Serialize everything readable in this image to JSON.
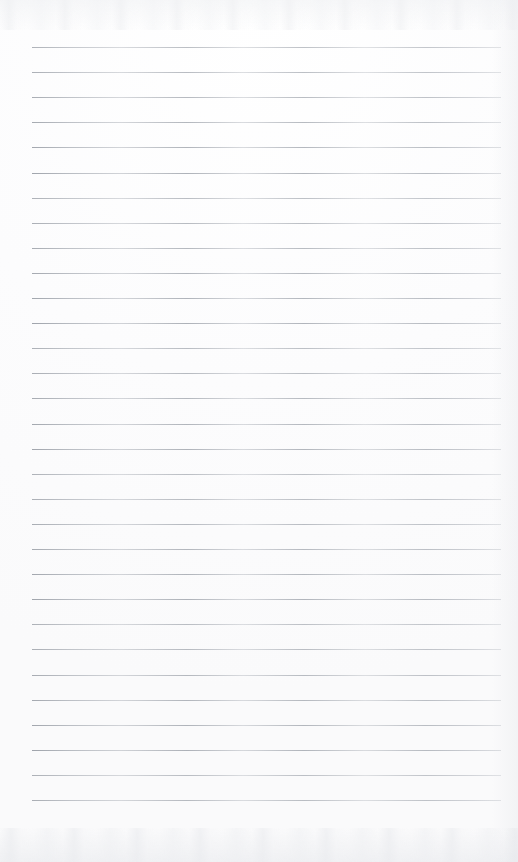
{
  "document": {
    "kind": "scanned-lined-notepad-page",
    "title": "Blank ruled notepad page",
    "text_content": "",
    "has_handwriting": false,
    "has_printed_text": false,
    "page_width_px": 518,
    "page_height_px": 862,
    "background_color": "#fdfdfd",
    "paper_tone": "white"
  },
  "ruling": {
    "style": "horizontal-ruled",
    "line_color": "#a4a9b1",
    "line_thickness_px": 1,
    "line_count": 31,
    "first_line_y_px": 47,
    "line_spacing_px": 25.1,
    "line_left_x_px": 32,
    "line_right_x_px": 501,
    "line_length_px": 469,
    "left_margin_px": 32,
    "right_margin_px": 17,
    "top_margin_px": 47,
    "bottom_margin_px": 60,
    "has_vertical_margin_rule": false,
    "has_holes": false
  },
  "scan_artifacts": {
    "top_band_label": "scanner-noise-top",
    "bottom_band_label": "scanner-noise-bottom",
    "right_edge_label": "scanner-edge-shading",
    "noise_color": "#e6e8ec"
  }
}
